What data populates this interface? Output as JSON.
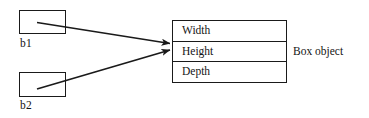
{
  "diagram": {
    "background_color": "#ffffff",
    "line_color": "#1a1a1a",
    "references": [
      {
        "id": "b1",
        "label": "b1"
      },
      {
        "id": "b2",
        "label": "b2"
      }
    ],
    "object": {
      "caption": "Box object",
      "fields": [
        {
          "name": "Width"
        },
        {
          "name": "Height"
        },
        {
          "name": "Depth"
        }
      ]
    },
    "arrows": [
      {
        "from": "b1",
        "to": "object",
        "head": "arrow-head-icon"
      },
      {
        "from": "b2",
        "to": "object",
        "head": "arrow-head-icon"
      }
    ]
  }
}
